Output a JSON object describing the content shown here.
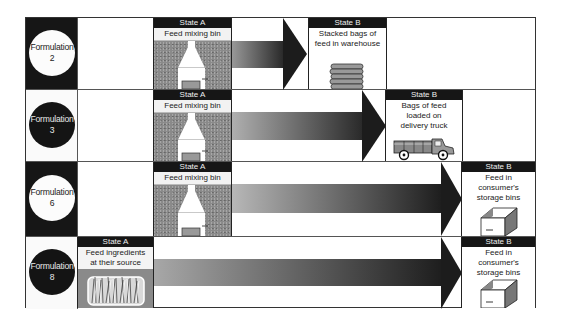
{
  "diagram": {
    "type": "process-flow-grid",
    "rows": [
      {
        "formulation": {
          "label": "Formulation",
          "number": "2",
          "style": "white-circle-on-dark"
        },
        "state_a": {
          "header": "State A",
          "label": "Feed mixing bin",
          "icon": "mixing-bin-icon"
        },
        "state_b": {
          "header": "State B",
          "label_lines": [
            "Stacked bags of",
            "feed in warehouse"
          ],
          "icon": "stacked-bags-icon"
        }
      },
      {
        "formulation": {
          "label": "Formulation",
          "number": "3",
          "style": "black-circle-on-light"
        },
        "state_a": {
          "header": "State A",
          "label": "Feed mixing bin",
          "icon": "mixing-bin-icon"
        },
        "state_b": {
          "header": "State B",
          "label_lines": [
            "Bags of feed",
            "loaded on",
            "delivery truck"
          ],
          "icon": "delivery-truck-icon"
        }
      },
      {
        "formulation": {
          "label": "Formulation",
          "number": "6",
          "style": "white-circle-on-dark"
        },
        "state_a": {
          "header": "State A",
          "label": "Feed mixing bin",
          "icon": "mixing-bin-icon"
        },
        "state_b": {
          "header": "State B",
          "label_lines": [
            "Feed in",
            "consumer's",
            "storage bins"
          ],
          "icon": "storage-bin-icon"
        }
      },
      {
        "formulation": {
          "label": "Formulation",
          "number": "8",
          "style": "black-circle-on-light"
        },
        "state_a": {
          "header": "State A",
          "label_lines": [
            "Feed ingredients",
            "at their source"
          ],
          "icon": "grass-field-icon"
        },
        "state_b": {
          "header": "State B",
          "label_lines": [
            "Feed in",
            "consumer's",
            "storage bins"
          ],
          "icon": "storage-bin-icon"
        }
      }
    ],
    "colors": {
      "dark": "#161616",
      "arrow_light": "#b8b8b8",
      "arrow_dark": "#1c1c1c",
      "speckle_gray": "#8a8a8a",
      "border": "#333333"
    }
  }
}
